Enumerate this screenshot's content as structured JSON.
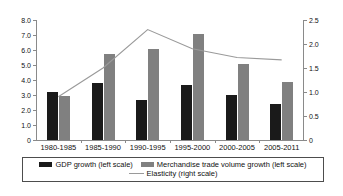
{
  "chart_data": {
    "type": "bar",
    "title": "",
    "subtitle": "",
    "xlabel": "",
    "ylabel": "",
    "categories": [
      "1980-1985",
      "1985-1990",
      "1990-1995",
      "1995-2000",
      "2000-2005",
      "2005-2011"
    ],
    "series": [
      {
        "name": "GDP growth (left scale)",
        "type": "bar",
        "axis": "left",
        "color": "#1a1a1a",
        "values": [
          3.2,
          3.8,
          2.7,
          3.65,
          3.0,
          2.4
        ]
      },
      {
        "name": "Merchandise trade volume growth (left scale)",
        "type": "bar",
        "axis": "left",
        "color": "#808080",
        "values": [
          2.95,
          5.75,
          6.1,
          7.1,
          5.05,
          3.85
        ]
      },
      {
        "name": "Elasticity (right scale)",
        "type": "line",
        "axis": "right",
        "color": "#9a9a9a",
        "values": [
          0.9,
          1.5,
          2.3,
          1.9,
          1.72,
          1.67
        ]
      }
    ],
    "left_axis": {
      "ylim": [
        0,
        8.0
      ],
      "ticks": [
        0,
        1.0,
        2.0,
        3.0,
        4.0,
        5.0,
        6.0,
        7.0,
        8.0
      ],
      "tick_labels": [
        "0",
        "1.0",
        "2.0",
        "3.0",
        "4.0",
        "5.0",
        "6.0",
        "7.0",
        "8.0"
      ]
    },
    "right_axis": {
      "ylim": [
        0,
        2.5
      ],
      "ticks": [
        0,
        0.5,
        1.0,
        1.5,
        2.0,
        2.5
      ],
      "tick_labels": [
        "0",
        "0.5",
        "1.0",
        "1.5",
        "2.0",
        "2.5"
      ]
    },
    "grid": false,
    "legend_position": "bottom"
  },
  "legend": {
    "items": [
      {
        "label": "GDP growth (left scale)",
        "marker": "black-square-swatch"
      },
      {
        "label": "Merchandise trade volume growth (left scale)",
        "marker": "gray-square-swatch"
      },
      {
        "label": "Elasticity (right scale)",
        "marker": "gray-line-swatch"
      }
    ]
  }
}
